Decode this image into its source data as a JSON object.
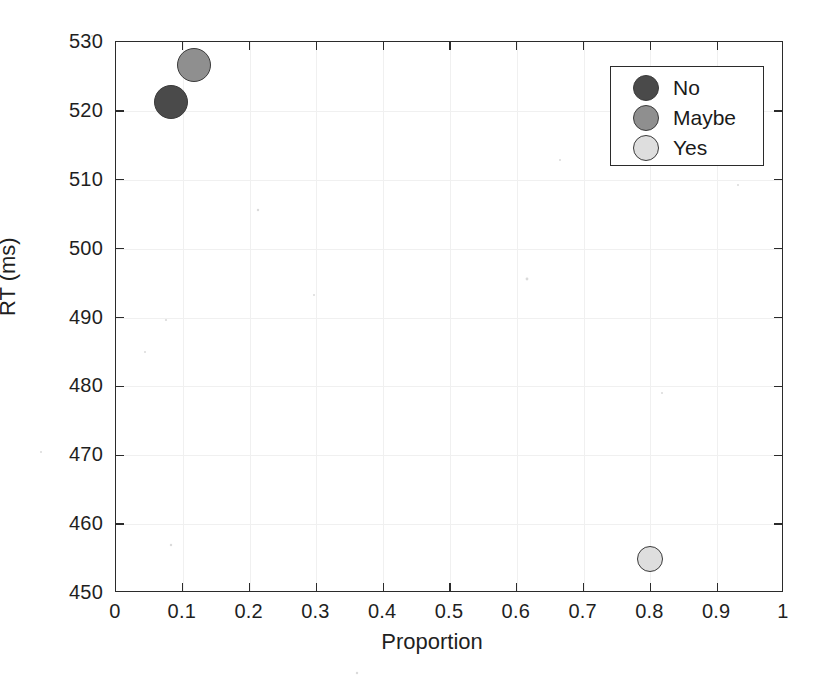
{
  "chart_data": {
    "type": "scatter",
    "title": "",
    "xlabel": "Proportion",
    "ylabel": "RT (ms)",
    "xlim": [
      0,
      1
    ],
    "ylim": [
      450,
      530
    ],
    "xticks": [
      "0",
      "0.1",
      "0.2",
      "0.3",
      "0.4",
      "0.5",
      "0.6",
      "0.7",
      "0.8",
      "0.9",
      "1"
    ],
    "xtick_values": [
      0,
      0.1,
      0.2,
      0.3,
      0.4,
      0.5,
      0.6,
      0.7,
      0.8,
      0.9,
      1
    ],
    "yticks": [
      "450",
      "460",
      "470",
      "480",
      "490",
      "500",
      "510",
      "520",
      "530"
    ],
    "ytick_values": [
      450,
      460,
      470,
      480,
      490,
      500,
      510,
      520,
      530
    ],
    "grid": true,
    "legend_position": "top-right",
    "series": [
      {
        "name": "No",
        "color": "#4a4a4a",
        "x": 0.082,
        "y": 521.3,
        "marker": "circle",
        "marker_size": 34
      },
      {
        "name": "Maybe",
        "color": "#8f8f8f",
        "x": 0.117,
        "y": 526.6,
        "marker": "circle",
        "marker_size": 34
      },
      {
        "name": "Yes",
        "color": "#dedede",
        "x": 0.8,
        "y": 455.0,
        "marker": "circle",
        "marker_size": 26
      }
    ]
  },
  "legend": {
    "items": [
      {
        "label": "No",
        "color": "#4a4a4a"
      },
      {
        "label": "Maybe",
        "color": "#8f8f8f"
      },
      {
        "label": "Yes",
        "color": "#dedede"
      }
    ]
  },
  "axes": {
    "x_title": "Proportion",
    "y_title": "RT (ms)"
  }
}
